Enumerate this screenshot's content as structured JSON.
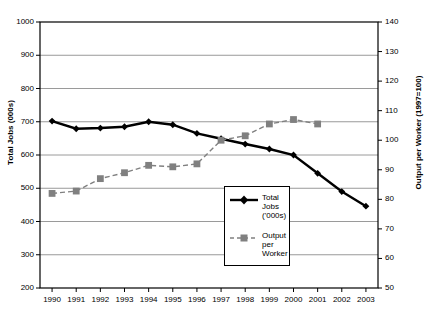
{
  "chart_data": {
    "type": "line",
    "title": "",
    "xlabel": "",
    "categories": [
      "1990",
      "1991",
      "1992",
      "1993",
      "1994",
      "1995",
      "1996",
      "1997",
      "1998",
      "1999",
      "2000",
      "2001",
      "2002",
      "2003"
    ],
    "grid": true,
    "legend_position": "inside-bottom-center",
    "axes": {
      "left": {
        "label": "Total Jobs (000s)",
        "min": 200,
        "max": 1000,
        "step": 100,
        "ticks": [
          "200",
          "300",
          "400",
          "500",
          "600",
          "700",
          "800",
          "900",
          "1000"
        ]
      },
      "right": {
        "label": "Output per Worker (1997=100)",
        "min": 50,
        "max": 140,
        "step": 10,
        "ticks": [
          "50",
          "60",
          "70",
          "80",
          "90",
          "100",
          "110",
          "120",
          "130",
          "140"
        ]
      }
    },
    "series": [
      {
        "name": "Total Jobs ('000s)",
        "axis": "left",
        "color": "#000000",
        "marker": "diamond",
        "line_style": "solid",
        "values": [
          702,
          679,
          681,
          685,
          700,
          691,
          665,
          649,
          633,
          618,
          600,
          545,
          490,
          446
        ]
      },
      {
        "name": "Output per Worker",
        "axis": "right",
        "color": "#808080",
        "marker": "square",
        "line_style": "dashed",
        "values": [
          82.0,
          82.8,
          87.0,
          89.0,
          91.5,
          91.0,
          92.0,
          100.0,
          101.5,
          105.5,
          107.0,
          105.5,
          null,
          null
        ]
      }
    ]
  },
  "legend": {
    "entries": [
      {
        "label": "Total\nJobs\n('000s)"
      },
      {
        "label": "Output\nper\nWorker"
      }
    ]
  },
  "colors": {
    "jobs_series": "#000000",
    "output_series": "#808080",
    "gridline": "#808080",
    "axis": "#000000",
    "background": "#ffffff"
  }
}
